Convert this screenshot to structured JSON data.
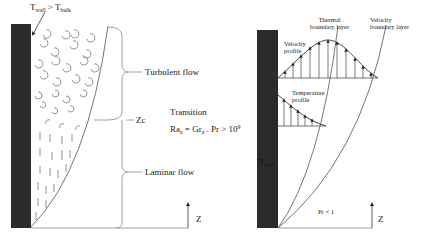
{
  "left_panel": {
    "wall_label": {
      "main": "T",
      "sub1": "wall",
      "rel": " > T",
      "sub2": "bulk"
    },
    "regions": {
      "turbulent": "Turbulent flow",
      "critical_height": "Zc",
      "transition": "Transition",
      "laminar": "Laminar flow"
    },
    "criterion": {
      "lhs": "Ra",
      "lhs_sub": "z",
      "eq": " = Gr",
      "gr_sub": "z",
      "dot": " . Pr > 10",
      "exp": "9"
    },
    "axis_label": "Z"
  },
  "right_panel": {
    "thermal_bl": [
      "Thermal",
      "boundary layer"
    ],
    "velocity_bl": [
      "Velocity",
      "boundary layer"
    ],
    "velocity_profile": [
      "Velocity",
      "profile"
    ],
    "temperature_profile": [
      "Temperature",
      "profile"
    ],
    "wall_label": "T",
    "wall_sub": "wall",
    "prandtl_note": "Pr < 1",
    "axis_label": "Z"
  },
  "colors": {
    "wall": "#2b2b2b",
    "line": "#555555",
    "text": "#222222"
  }
}
